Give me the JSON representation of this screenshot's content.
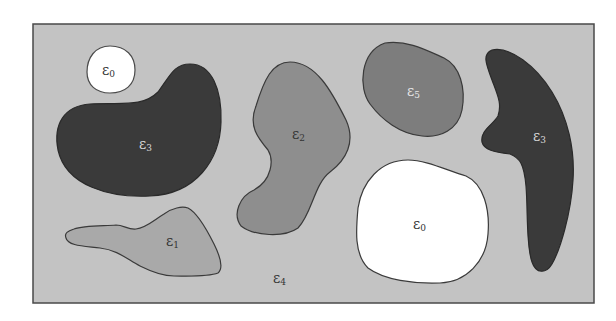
{
  "diagram": {
    "background_region": {
      "label": "ε",
      "subscript": "4",
      "fill": "#c3c3c3"
    },
    "frame_stroke": "#4a4a4a",
    "regions": [
      {
        "id": "r0a",
        "label": "ε",
        "subscript": "0",
        "fill": "#ffffff",
        "text_color": "#333333"
      },
      {
        "id": "r3a",
        "label": "ε",
        "subscript": "3",
        "fill": "#3a3a3a",
        "text_color": "#d8d8d8"
      },
      {
        "id": "r2",
        "label": "ε",
        "subscript": "2",
        "fill": "#8e8e8e",
        "text_color": "#333333"
      },
      {
        "id": "r5",
        "label": "ε",
        "subscript": "5",
        "fill": "#7d7d7d",
        "text_color": "#e6e6e6"
      },
      {
        "id": "r3b",
        "label": "ε",
        "subscript": "3",
        "fill": "#3a3a3a",
        "text_color": "#d8d8d8"
      },
      {
        "id": "r0b",
        "label": "ε",
        "subscript": "0",
        "fill": "#ffffff",
        "text_color": "#333333"
      },
      {
        "id": "r1",
        "label": "ε",
        "subscript": "1",
        "fill": "#a9a9a9",
        "text_color": "#333333"
      }
    ]
  }
}
